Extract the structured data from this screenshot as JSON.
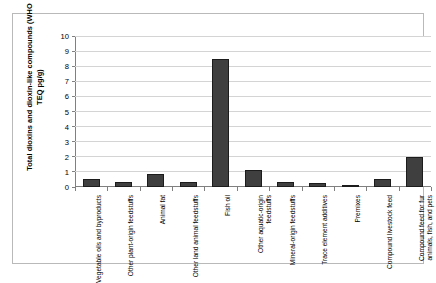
{
  "chart_data": {
    "type": "bar",
    "title": "",
    "xlabel": "",
    "ylabel": "Total dioxins and dioxin-like compounds (WHO TEQ pg/g)",
    "ylim": [
      0,
      10
    ],
    "yticks": [
      0,
      1,
      2,
      3,
      4,
      5,
      6,
      7,
      8,
      9,
      10
    ],
    "ytick_labels": [
      "0",
      "1",
      "2",
      "3",
      "4",
      "5",
      "6",
      "7",
      "8",
      "9",
      "10"
    ],
    "grid": true,
    "legend": "none",
    "bar_color": "#3f3f3f",
    "bar_edge_color": "#1c1c1c",
    "categories": [
      "Vegetable oils and byproducts",
      "Other plant-origin feedstuffs",
      "Animal fat",
      "Other land animal feedstuffs",
      "Fish oil",
      "Other aquatic-origin feedstuffs",
      "Mineral-origin feedstuffs",
      "Trace element additives",
      "Premixes",
      "Compound livestock feed",
      "Compound feed for fur animals, fish, and pets"
    ],
    "values": [
      0.5,
      0.3,
      0.85,
      0.3,
      8.5,
      1.1,
      0.3,
      0.25,
      0.15,
      0.55,
      2.0
    ]
  }
}
